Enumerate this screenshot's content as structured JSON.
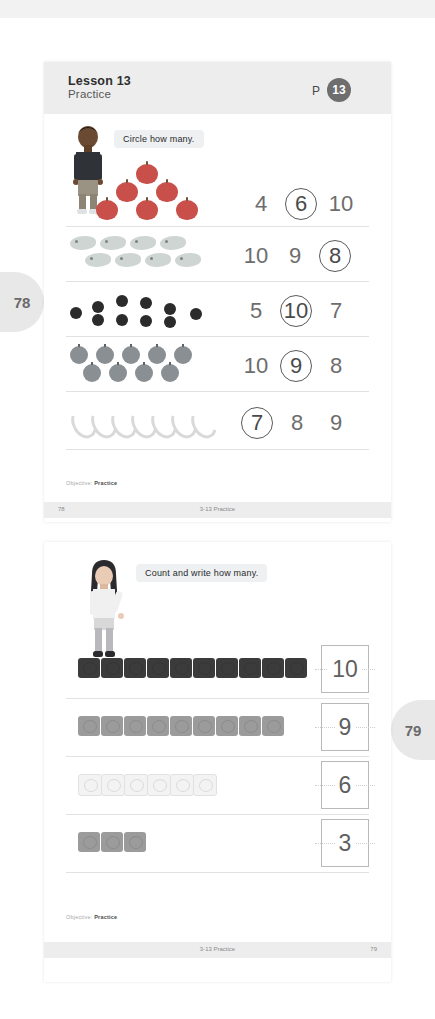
{
  "document": {
    "title": "Lesson 13 Practice Worksheet",
    "background_color": "#ffffff"
  },
  "side_tabs": [
    {
      "name": "page-tab-78",
      "label": "78",
      "side": "left"
    },
    {
      "name": "page-tab-79",
      "label": "79",
      "side": "right"
    }
  ],
  "page_a": {
    "header": {
      "lesson": "Lesson 13",
      "subtitle": "Practice",
      "p_label": "P",
      "p_number": "13"
    },
    "instruction": "Circle how many.",
    "character": "boy-character",
    "rows": [
      {
        "name": "exercise-row-apples",
        "object": "apple",
        "count": 6,
        "layout": "triangle",
        "options": [
          "4",
          "6",
          "10"
        ],
        "circled": "6"
      },
      {
        "name": "exercise-row-fish",
        "object": "fish",
        "count": 8,
        "layout": "two-rows",
        "options": [
          "10",
          "9",
          "8"
        ],
        "circled": "8"
      },
      {
        "name": "exercise-row-berries",
        "object": "berry",
        "count": 10,
        "layout": "zigzag",
        "options": [
          "5",
          "10",
          "7"
        ],
        "circled": "10"
      },
      {
        "name": "exercise-row-plums",
        "object": "plum",
        "count": 9,
        "layout": "two-rows",
        "options": [
          "10",
          "9",
          "8"
        ],
        "circled": "9"
      },
      {
        "name": "exercise-row-bananas",
        "object": "banana",
        "count": 7,
        "layout": "single-row",
        "options": [
          "7",
          "8",
          "9"
        ],
        "circled": "7"
      }
    ],
    "objective_label": "Objective:",
    "objective_value": "Practice",
    "footer": {
      "page_number": "78",
      "center": "3-13 Practice"
    }
  },
  "page_b": {
    "instruction": "Count and write how many.",
    "character": "girl-character",
    "rows": [
      {
        "name": "count-row-dark-cubes",
        "object": "cube-dark",
        "count": 10,
        "answer": "10"
      },
      {
        "name": "count-row-gray-cubes",
        "object": "cube-gray",
        "count": 9,
        "answer": "9"
      },
      {
        "name": "count-row-light-cubes",
        "object": "cube-light",
        "count": 6,
        "answer": "6"
      },
      {
        "name": "count-row-small-gray-cubes",
        "object": "cube-gray",
        "count": 3,
        "answer": "3"
      }
    ],
    "objective_label": "Objective:",
    "objective_value": "Practice",
    "footer": {
      "center": "3-13 Practice",
      "page_number": "79"
    }
  }
}
